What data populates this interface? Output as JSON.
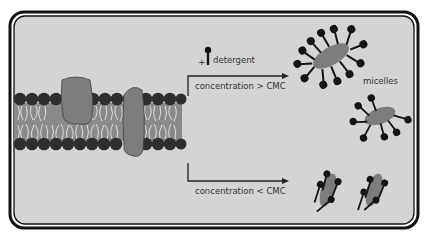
{
  "figure": {
    "colors": {
      "background": "#d4d4d4",
      "frame": "#111111",
      "lipid_head": "#2e2e2e",
      "lipid_core": "#8a8a8a",
      "protein": "#7d7d7d",
      "detergent": "#151515",
      "text": "#333333"
    }
  },
  "labels": {
    "detergent_plus": "+",
    "detergent": "detergent",
    "above_cmc": "concentration > CMC",
    "below_cmc": "concentration < CMC",
    "micelles": "micelles"
  },
  "elements": {
    "membrane": "lipid bilayer with two embedded proteins",
    "upper_path": "protein-detergent micelles",
    "lower_path": "proteins with bound detergent monomers"
  }
}
